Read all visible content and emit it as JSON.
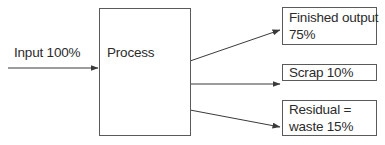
{
  "diagram": {
    "type": "process-flow",
    "input": {
      "label": "Input 100%"
    },
    "process": {
      "label": "Process"
    },
    "outputs": [
      {
        "line1": "Finished output",
        "line2": "75%"
      },
      {
        "line1": "Scrap 10%"
      },
      {
        "line1": "Residual =",
        "line2": "waste 15%"
      }
    ],
    "colors": {
      "line": "#3a3a3a",
      "border": "#5a5a5a",
      "text": "#2b2b2b"
    }
  }
}
